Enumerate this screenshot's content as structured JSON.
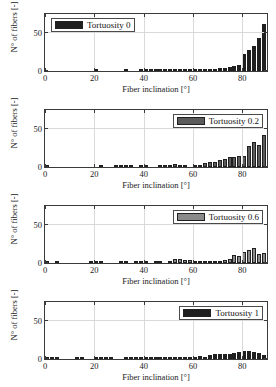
{
  "figure": {
    "type": "multi-panel-histogram",
    "panel_count": 4
  },
  "axis": {
    "xlabel": "Fiber inclination [°]",
    "ylabel": "N° of fibers [-]",
    "xticks": [
      "0",
      "20",
      "40",
      "60",
      "80"
    ],
    "yticks": [
      "0",
      "50"
    ],
    "xlim": [
      0,
      90
    ],
    "ylim": [
      0,
      75
    ],
    "xtick_values": [
      0,
      20,
      40,
      60,
      80
    ],
    "ytick_values": [
      0,
      50
    ]
  },
  "chart_data": [
    {
      "type": "bar",
      "title": "Tortuosity 0",
      "legend": "Tortuosity 0",
      "color": "#1f1f1f",
      "xlabel": "Fiber inclination [°]",
      "ylabel": "N° of fibers [-]",
      "xlim": [
        0,
        90
      ],
      "ylim": [
        0,
        75
      ],
      "xticks": [
        0,
        20,
        40,
        60,
        80
      ],
      "yticks": [
        0,
        50
      ],
      "grid": true,
      "legend_position": "upper-left",
      "bin_width": 2,
      "x": [
        1,
        3,
        5,
        7,
        9,
        11,
        13,
        15,
        17,
        19,
        21,
        23,
        25,
        27,
        29,
        31,
        33,
        35,
        37,
        39,
        41,
        43,
        45,
        47,
        49,
        51,
        53,
        55,
        57,
        59,
        61,
        63,
        65,
        67,
        69,
        71,
        73,
        75,
        77,
        79,
        81,
        83,
        85,
        87,
        89
      ],
      "values": [
        0,
        0,
        0,
        0,
        0,
        0,
        0,
        0,
        0,
        0,
        1.5,
        0,
        0,
        0,
        0,
        0,
        1.2,
        0,
        0,
        1,
        1,
        1,
        1.5,
        1,
        1.2,
        1.5,
        1.5,
        1,
        1,
        1,
        3,
        1.5,
        2.5,
        3,
        3,
        4,
        4,
        5,
        6,
        8,
        23,
        27,
        33,
        44,
        62
      ]
    },
    {
      "type": "bar",
      "title": "Tortuosity 0.2",
      "legend": "Tortuosity 0.2",
      "color": "#5b5b5b",
      "xlabel": "Fiber inclination [°]",
      "ylabel": "N° of fibers [-]",
      "xlim": [
        0,
        90
      ],
      "ylim": [
        0,
        75
      ],
      "xticks": [
        0,
        20,
        40,
        60,
        80
      ],
      "yticks": [
        0,
        50
      ],
      "grid": true,
      "legend_position": "upper-right",
      "bin_width": 2,
      "x": [
        1,
        3,
        5,
        7,
        9,
        11,
        13,
        15,
        17,
        19,
        21,
        23,
        25,
        27,
        29,
        31,
        33,
        35,
        37,
        39,
        41,
        43,
        45,
        47,
        49,
        51,
        53,
        55,
        57,
        59,
        61,
        63,
        65,
        67,
        69,
        71,
        73,
        75,
        77,
        79,
        81,
        83,
        85,
        87,
        89
      ],
      "values": [
        0.8,
        0,
        0,
        0,
        0,
        0,
        0,
        0,
        0,
        0,
        0,
        1.2,
        0,
        0,
        0.8,
        1,
        1.5,
        1,
        0,
        1.5,
        1.5,
        0,
        0,
        1,
        1,
        1.5,
        3.5,
        2.5,
        1,
        0,
        0.8,
        1.5,
        5,
        6,
        7,
        9,
        11,
        13,
        13,
        14,
        15,
        27,
        33,
        29,
        42
      ]
    },
    {
      "type": "bar",
      "title": "Tortuosity 0.6",
      "legend": "Tortuosity 0.6",
      "color": "#8a8a8a",
      "xlabel": "Fiber inclination [°]",
      "ylabel": "N° of fibers [-]",
      "xlim": [
        0,
        90
      ],
      "ylim": [
        0,
        75
      ],
      "xticks": [
        0,
        20,
        40,
        60,
        80
      ],
      "yticks": [
        0,
        50
      ],
      "grid": true,
      "legend_position": "upper-right",
      "bin_width": 2,
      "x": [
        1,
        3,
        5,
        7,
        9,
        11,
        13,
        15,
        17,
        19,
        21,
        23,
        25,
        27,
        29,
        31,
        33,
        35,
        37,
        39,
        41,
        43,
        45,
        47,
        49,
        51,
        53,
        55,
        57,
        59,
        61,
        63,
        65,
        67,
        69,
        71,
        73,
        75,
        77,
        79,
        81,
        83,
        85,
        87,
        89
      ],
      "values": [
        1.2,
        0,
        1,
        0,
        0,
        0,
        0,
        0,
        0,
        1,
        1.2,
        1.5,
        0,
        0,
        0,
        1,
        1,
        0,
        1.2,
        1.5,
        1,
        0,
        1.5,
        1,
        0,
        1.5,
        5,
        5,
        4,
        3.5,
        3,
        2.5,
        3,
        2,
        2,
        2.5,
        4,
        5,
        11,
        9,
        14,
        17,
        20,
        12,
        13
      ]
    },
    {
      "type": "bar",
      "title": "Tortuosity 1",
      "legend": "Tortuosity 1",
      "color": "#1f1f1f",
      "xlabel": "Fiber inclination [°]",
      "ylabel": "N° of fibers [-]",
      "xlim": [
        0,
        90
      ],
      "ylim": [
        0,
        75
      ],
      "xticks": [
        0,
        20,
        40,
        60,
        80
      ],
      "yticks": [
        0,
        50
      ],
      "grid": true,
      "legend_position": "upper-right",
      "bin_width": 2,
      "x": [
        1,
        3,
        5,
        7,
        9,
        11,
        13,
        15,
        17,
        19,
        21,
        23,
        25,
        27,
        29,
        31,
        33,
        35,
        37,
        39,
        41,
        43,
        45,
        47,
        49,
        51,
        53,
        55,
        57,
        59,
        61,
        63,
        65,
        67,
        69,
        71,
        73,
        75,
        77,
        79,
        81,
        83,
        85,
        87,
        89
      ],
      "values": [
        1,
        0.8,
        1,
        0,
        0,
        0,
        1,
        1,
        0,
        0,
        2,
        1.5,
        1,
        0.8,
        0,
        0,
        1.5,
        1,
        1,
        2,
        2,
        2.5,
        2.5,
        3,
        3,
        2.5,
        2,
        2.5,
        3,
        3,
        3,
        3.5,
        3,
        5,
        6,
        6,
        6,
        7,
        8,
        9,
        10,
        11,
        9,
        8,
        5
      ]
    }
  ]
}
